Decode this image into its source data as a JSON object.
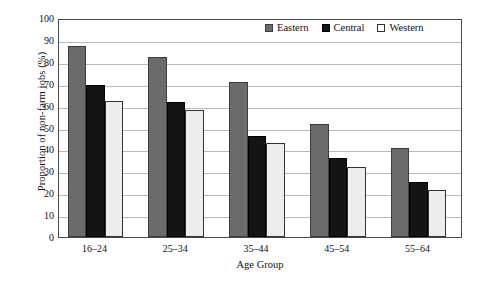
{
  "chart_data": {
    "type": "bar",
    "title": "",
    "xlabel": "Age Group",
    "ylabel": "Proportion of non-farm jobs (%)",
    "categories": [
      "16–24",
      "25–34",
      "35–44",
      "45–54",
      "55–64"
    ],
    "series": [
      {
        "name": "Eastern",
        "color": "#6b6b6b",
        "values": [
          87,
          82,
          71,
          51.5,
          40.5
        ]
      },
      {
        "name": "Central",
        "color": "#141414",
        "values": [
          69.5,
          61.5,
          46,
          36,
          25
        ]
      },
      {
        "name": "Western",
        "color": "#ededed",
        "values": [
          62,
          58,
          43,
          32,
          21.5
        ]
      }
    ],
    "ylim": [
      0,
      100
    ],
    "yticks": [
      0,
      10,
      20,
      30,
      40,
      50,
      60,
      70,
      80,
      90,
      100
    ],
    "ytick_labels": [
      "0",
      "10",
      "20",
      "30",
      "40",
      "50",
      "60",
      "70",
      "80",
      "90",
      "100"
    ],
    "grid": true,
    "legend_position": "top-right",
    "legend": [
      "Eastern",
      "Central",
      "Western"
    ]
  }
}
